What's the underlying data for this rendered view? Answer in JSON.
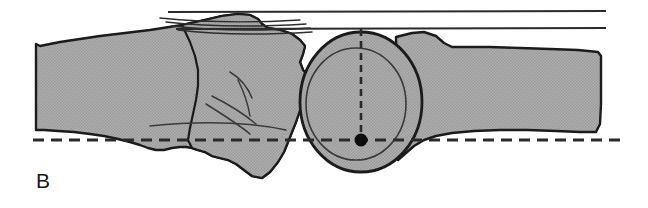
{
  "figure": {
    "panel_label": "B",
    "panel_label_x": 36,
    "panel_label_y": 170,
    "caption_alt": "Lateral tracing of joint with reference lines",
    "width": 648,
    "height": 208,
    "background_color": "#ffffff"
  },
  "colors": {
    "bone_fill": "#aaaaaa",
    "bone_fill_light": "#b4b4b4",
    "outline": "#1b1b1b",
    "detail_line": "#3a3a3a",
    "dash_line": "#2a2a2a",
    "solid_ref_line": "#2b2b2b",
    "marker_dot": "#0d0d0d",
    "label_color": "#1a1a1a"
  },
  "annotations": {
    "upper_reference_line": {
      "name": "Upper shaft reference line",
      "type": "solid",
      "x1": 168,
      "y1": 12,
      "x2": 606,
      "y2": 11
    },
    "lower_reference_line": {
      "name": "Lower shaft reference line",
      "type": "solid",
      "x1": 176,
      "y1": 29,
      "x2": 606,
      "y2": 28
    },
    "vertical_axis": {
      "name": "Vertical center axis",
      "type": "dashed",
      "x1": 361,
      "y1": 29,
      "x2": 361,
      "y2": 140,
      "dash": "7 5"
    },
    "horizontal_baseline": {
      "name": "Horizontal baseline",
      "type": "dashed",
      "x1": 33,
      "y1": 140,
      "x2": 622,
      "y2": 140,
      "dash": "11 7"
    },
    "center_marker": {
      "name": "Rotation center marker",
      "cx": 361,
      "cy": 140,
      "r": 6.5
    }
  },
  "shapes": {
    "left_bone": {
      "name": "Proximal bone shaft (left)",
      "path": "M 36,44 L 40,46 L 60,42 L 100,36 L 150,30 L 182,25 L 205,20 L 222,16 L 238,14 L 250,15 L 258,19 L 262,24 L 268,28 L 280,30 L 292,34 L 300,40 L 305,46 L 303,54 L 300,62 L 303,70 L 308,76 L 312,84 L 310,92 L 305,100 L 300,110 L 296,122 L 292,132 L 288,142 L 284,152 L 278,162 L 270,172 L 262,178 L 252,176 L 244,170 L 236,164 L 228,160 L 220,158 L 212,156 L 205,152 L 198,150 L 192,148 L 186,147 L 180,147 L 172,148 L 164,150 L 156,150 L 148,148 L 140,145 L 130,142 L 118,139 L 104,136 L 90,134 L 74,132 L 58,131 L 44,130 L 36,130 Z"
    },
    "mid_bone": {
      "name": "Distal condyle mass (mid)",
      "path": "M 182,25 L 205,20 L 222,16 L 238,14 L 250,15 L 258,19 L 262,24 L 268,28 L 280,30 L 292,34 L 300,40 L 305,46 L 303,54 L 300,62 L 303,70 L 308,76 L 312,84 L 310,92 L 305,100 L 300,110 L 296,122 L 292,132 L 288,142 L 284,152 L 278,162 L 270,172 L 262,178 L 252,176 L 244,170 L 236,164 L 228,160 L 220,158 L 212,156 L 205,152 L 198,150 L 192,148 L 188,140 L 190,128 L 193,114 L 196,100 L 198,86 L 198,70 L 195,56 L 190,42 Z"
    },
    "right_bone": {
      "name": "Distal bone shaft (right)",
      "path": "M 396,37 L 412,33 L 424,32 L 436,36 L 444,43 L 452,47 L 468,47 L 490,47 L 520,48 L 550,49 L 578,50 L 598,52 L 601,56 L 601,78 L 601,104 L 600,124 L 596,132 L 580,132 L 556,131 L 528,130 L 500,130 L 474,131 L 452,133 L 436,136 L 424,140 L 414,146 L 406,153 L 398,160 Z"
    },
    "circle_outer": {
      "name": "Capitellum outer circle",
      "cx": 361,
      "cy": 102,
      "rx": 61,
      "ry": 70
    },
    "circle_inner": {
      "name": "Capitellum inner arc circle",
      "cx": 356,
      "cy": 104,
      "rx": 50,
      "ry": 56
    },
    "tendon_lines": [
      {
        "name": "tendon-line-1",
        "path": "M 160,18 C 200,22 250,23 300,20"
      },
      {
        "name": "tendon-line-2",
        "path": "M 166,22 C 210,27 258,27 306,24"
      },
      {
        "name": "tendon-line-3",
        "path": "M 172,26 C 214,31 262,31 310,28"
      },
      {
        "name": "tendon-line-4",
        "path": "M 178,30 C 218,35 264,35 312,32"
      }
    ],
    "detail_lines": [
      {
        "name": "detail-line-1",
        "path": "M 230,72 C 240,78 248,88 252,98"
      },
      {
        "name": "detail-line-2",
        "path": "M 212,96 C 228,104 244,114 256,124"
      },
      {
        "name": "detail-line-3",
        "path": "M 206,104 C 222,114 238,124 250,134"
      },
      {
        "name": "detail-line-4",
        "path": "M 238,80 C 244,92 248,104 250,116"
      },
      {
        "name": "detail-line-5",
        "path": "M 150,126 C 200,121 248,122 286,130"
      }
    ]
  }
}
